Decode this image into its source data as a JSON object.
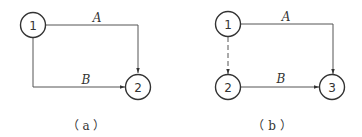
{
  "diagrams": [
    {
      "id": "a",
      "caption": "（ a ）",
      "nodes": [
        {
          "label": "1"
        },
        {
          "label": "2"
        }
      ],
      "edges": [
        {
          "label": "A",
          "from": "1",
          "to": "2",
          "style": "solid"
        },
        {
          "label": "B",
          "from": "1",
          "to": "2",
          "style": "solid"
        }
      ]
    },
    {
      "id": "b",
      "caption": "（ b ）",
      "nodes": [
        {
          "label": "1"
        },
        {
          "label": "2"
        },
        {
          "label": "3"
        }
      ],
      "edges": [
        {
          "label": "A",
          "from": "1",
          "to": "3",
          "style": "solid"
        },
        {
          "label": "",
          "from": "1",
          "to": "2",
          "style": "dashed"
        },
        {
          "label": "B",
          "from": "2",
          "to": "3",
          "style": "solid"
        }
      ]
    }
  ],
  "colors": {
    "stroke": "#333333",
    "edge": "#555555",
    "background": "#ffffff"
  }
}
